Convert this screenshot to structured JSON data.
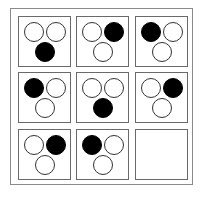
{
  "puzzle": {
    "rows": 3,
    "cols": 3,
    "colors": {
      "filled": "#000000",
      "empty": "#ffffff",
      "border": "#6a6a6a"
    },
    "cells": [
      {
        "dots": [
          "empty",
          "empty",
          "filled"
        ]
      },
      {
        "dots": [
          "empty",
          "filled",
          "empty"
        ]
      },
      {
        "dots": [
          "filled",
          "empty",
          "empty"
        ]
      },
      {
        "dots": [
          "filled",
          "empty",
          "empty"
        ]
      },
      {
        "dots": [
          "empty",
          "empty",
          "filled"
        ]
      },
      {
        "dots": [
          "empty",
          "filled",
          "empty"
        ]
      },
      {
        "dots": [
          "empty",
          "filled",
          "empty"
        ]
      },
      {
        "dots": [
          "filled",
          "empty",
          "empty"
        ]
      },
      {
        "dots": [],
        "blank": true
      }
    ]
  }
}
